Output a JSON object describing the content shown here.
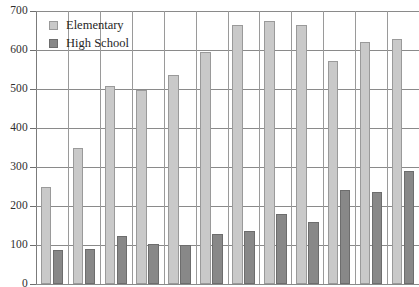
{
  "chart_data": {
    "type": "bar",
    "title": "",
    "xlabel": "",
    "ylabel": "",
    "ylim": [
      0,
      700
    ],
    "ytick_values": [
      700,
      600,
      500,
      400,
      300,
      200,
      100,
      0
    ],
    "ytick_labels": [
      "700",
      "600",
      "500",
      "400",
      "300",
      "200",
      "100",
      "0"
    ],
    "grid": "horizontal-and-vertical",
    "legend_position": "top-left-inside",
    "categories": [
      "1",
      "2",
      "3",
      "4",
      "5",
      "6",
      "7",
      "8",
      "9",
      "10",
      "11",
      "12"
    ],
    "xtick_labels": [],
    "series": [
      {
        "name": "Elementary",
        "color": "#c9c9c9",
        "values": [
          248,
          350,
          508,
          497,
          535,
          595,
          665,
          675,
          665,
          573,
          620,
          628
        ]
      },
      {
        "name": "High School",
        "color": "#888888",
        "values": [
          86,
          90,
          122,
          103,
          99,
          129,
          135,
          180,
          158,
          240,
          235,
          290
        ]
      }
    ]
  },
  "legend": {
    "items": [
      {
        "label": "Elementary",
        "swatch": "elementary"
      },
      {
        "label": "High School",
        "swatch": "highschool"
      }
    ]
  },
  "axis": {
    "y_label_700": "700",
    "y_label_600": "600",
    "y_label_500": "500",
    "y_label_400": "400",
    "y_label_300": "300",
    "y_label_200": "200",
    "y_label_100": "100",
    "y_label_0": "0"
  },
  "colors": {
    "elementary": "#c9c9c9",
    "high_school": "#888888",
    "gridline": "#8a8a8a",
    "axis": "#7b7b7b",
    "text": "#2e2e2e",
    "background": "#ffffff"
  }
}
